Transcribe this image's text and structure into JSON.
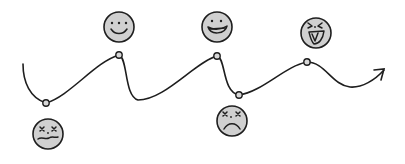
{
  "diagram": {
    "type": "emotional-journey-curve",
    "colors": {
      "stroke": "#1e1e1e",
      "face_fill": "#d0d0d0",
      "node_fill": "#d8d8d8",
      "background": "#ffffff"
    },
    "path": {
      "description": "wavy line ending in arrow pointing right",
      "direction": "left-to-right"
    },
    "nodes": [
      {
        "id": "node-1",
        "x": 46,
        "y": 103,
        "position": "low"
      },
      {
        "id": "node-2",
        "x": 119,
        "y": 55,
        "position": "high"
      },
      {
        "id": "node-3",
        "x": 217,
        "y": 56,
        "position": "high"
      },
      {
        "id": "node-4",
        "x": 239,
        "y": 95,
        "position": "low"
      },
      {
        "id": "node-5",
        "x": 307,
        "y": 62,
        "position": "high"
      }
    ],
    "faces": [
      {
        "id": "face-1",
        "emotion": "dizzy-unhappy",
        "icon": "dizzy-wavy-mouth-face-icon",
        "x": 48,
        "y": 134,
        "placement": "below"
      },
      {
        "id": "face-2",
        "emotion": "happy",
        "icon": "smiling-face-icon",
        "x": 119,
        "y": 27,
        "placement": "above"
      },
      {
        "id": "face-3",
        "emotion": "very-happy",
        "icon": "grinning-face-icon",
        "x": 217,
        "y": 27,
        "placement": "above"
      },
      {
        "id": "face-4",
        "emotion": "dizzy-sad",
        "icon": "dizzy-frowning-face-icon",
        "x": 232,
        "y": 121,
        "placement": "below"
      },
      {
        "id": "face-5",
        "emotion": "laughing",
        "icon": "laughing-squinting-face-icon",
        "x": 316,
        "y": 33,
        "placement": "above"
      }
    ],
    "arrow": {
      "icon": "arrow-head-icon",
      "tip_x": 384,
      "tip_y": 70
    }
  }
}
